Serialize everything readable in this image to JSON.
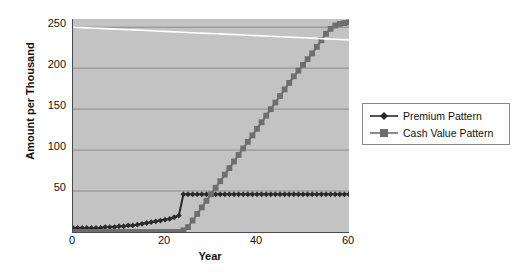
{
  "chart_data": {
    "type": "line",
    "title": "",
    "xlabel": "Year",
    "ylabel": "Amount per Thousand",
    "xlim": [
      0,
      60
    ],
    "ylim": [
      0,
      260
    ],
    "xticks": [
      0,
      20,
      40,
      60
    ],
    "yticks": [
      50,
      100,
      150,
      200,
      250
    ],
    "grid": true,
    "legend_position": "right",
    "x": [
      0,
      1,
      2,
      3,
      4,
      5,
      6,
      7,
      8,
      9,
      10,
      11,
      12,
      13,
      14,
      15,
      16,
      17,
      18,
      19,
      20,
      21,
      22,
      23,
      24,
      25,
      26,
      27,
      28,
      29,
      30,
      31,
      32,
      33,
      34,
      35,
      36,
      37,
      38,
      39,
      40,
      41,
      42,
      43,
      44,
      45,
      46,
      47,
      48,
      49,
      50,
      51,
      52,
      53,
      54,
      55,
      56,
      57,
      58,
      59,
      60
    ],
    "series": [
      {
        "name": "Premium Pattern",
        "marker": "diamond",
        "color": "#2b2b2b",
        "values": [
          5,
          5,
          5,
          5,
          5,
          5,
          5,
          6,
          6,
          6,
          7,
          7,
          8,
          8,
          9,
          10,
          11,
          12,
          13,
          14,
          15,
          16,
          18,
          20,
          46,
          46,
          46,
          46,
          46,
          46,
          46,
          46,
          46,
          46,
          46,
          46,
          46,
          46,
          46,
          46,
          46,
          46,
          46,
          46,
          46,
          46,
          46,
          46,
          46,
          46,
          46,
          46,
          46,
          46,
          46,
          46,
          46,
          46,
          46,
          46,
          46
        ]
      },
      {
        "name": "Cash Value Pattern",
        "marker": "square",
        "color": "#6e6e6e",
        "values": [
          0,
          0,
          0,
          0,
          0,
          0,
          0,
          0,
          0,
          0,
          0,
          0,
          0,
          0,
          0,
          0,
          0,
          0,
          0,
          0,
          0,
          0,
          0,
          0,
          2,
          6,
          14,
          22,
          30,
          38,
          46,
          54,
          62,
          70,
          78,
          86,
          94,
          102,
          110,
          118,
          126,
          134,
          142,
          150,
          158,
          166,
          174,
          182,
          190,
          197,
          204,
          211,
          218,
          226,
          234,
          242,
          248,
          252,
          254,
          255,
          256
        ]
      },
      {
        "name": "Death Benefit",
        "marker": "none",
        "color": "#ffffff",
        "in_legend": false,
        "values": [
          250,
          249.7,
          249.5,
          249.2,
          249,
          248.7,
          248.5,
          248.2,
          248,
          247.7,
          247.4,
          247.2,
          246.9,
          246.7,
          246.4,
          246.2,
          245.9,
          245.6,
          245.4,
          245.1,
          244.9,
          244.6,
          244.3,
          244.1,
          243.8,
          243.6,
          243.3,
          243,
          242.8,
          242.5,
          242.3,
          242,
          241.8,
          241.5,
          241.2,
          241,
          240.7,
          240.5,
          240.2,
          239.9,
          239.7,
          239.4,
          239.2,
          238.9,
          238.6,
          238.4,
          238.1,
          237.9,
          237.6,
          237.4,
          237.1,
          236.8,
          236.6,
          236.3,
          236.1,
          235.8,
          235.5,
          235.3,
          235,
          234.8,
          234.5
        ]
      }
    ],
    "legend_entries": [
      {
        "label": "Premium Pattern",
        "marker": "diamond",
        "color": "#2b2b2b"
      },
      {
        "label": "Cash Value Pattern",
        "marker": "square",
        "color": "#6e6e6e"
      }
    ],
    "colors": {
      "plot_background": "#c3c3c3",
      "page_background": "#ffffff",
      "gridline": "#7a7a7a",
      "axis": "#4a4a4a",
      "premium": "#2b2b2b",
      "cash_value": "#6e6e6e",
      "death_benefit": "#ffffff"
    },
    "ytick_labels": [
      "50",
      "100",
      "150",
      "200",
      "250"
    ],
    "xtick_labels": [
      "0",
      "20",
      "40",
      "60"
    ]
  }
}
